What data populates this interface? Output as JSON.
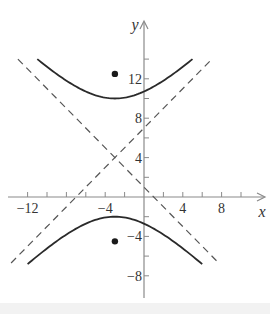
{
  "chart_data": {
    "type": "line",
    "title": "",
    "xlabel": "x",
    "ylabel": "y",
    "xlim": [
      -14,
      12
    ],
    "ylim": [
      -10,
      16
    ],
    "grid": false,
    "x_ticks": [
      -12,
      -10,
      -8,
      -6,
      -4,
      -2,
      2,
      4,
      6,
      8,
      10
    ],
    "x_tick_labels": [
      {
        "value": -12,
        "label": "−12"
      },
      {
        "value": -4,
        "label": "−4"
      },
      {
        "value": 4,
        "label": "4"
      },
      {
        "value": 8,
        "label": "8"
      }
    ],
    "y_ticks": [
      -8,
      -6,
      -4,
      -2,
      2,
      4,
      6,
      8,
      10,
      12,
      14
    ],
    "y_tick_labels": [
      {
        "value": 12,
        "label": "12"
      },
      {
        "value": 8,
        "label": "8"
      },
      {
        "value": 4,
        "label": "4"
      },
      {
        "value": -4,
        "label": "−4"
      },
      {
        "value": -8,
        "label": "−8"
      }
    ],
    "series": [
      {
        "name": "hyperbola upper branch",
        "style": "solid",
        "equation": "(y-4)^2/36 - (x+3)^2/36 = 1",
        "x_range": [
          -11,
          5
        ],
        "center": [
          -3,
          4
        ],
        "vertex": [
          -3,
          10
        ]
      },
      {
        "name": "hyperbola lower branch",
        "style": "solid",
        "equation": "(y-4)^2/36 - (x+3)^2/36 = 1",
        "x_range": [
          -12,
          6
        ],
        "center": [
          -3,
          4
        ],
        "vertex": [
          -3,
          -2
        ]
      },
      {
        "name": "asymptote y = x + 7",
        "style": "dashed",
        "x_range": [
          -13.7,
          6.8
        ]
      },
      {
        "name": "asymptote y = -x + 1",
        "style": "dashed",
        "x_range": [
          -13,
          7.5
        ]
      }
    ],
    "points": [
      {
        "name": "focus upper",
        "x": -3,
        "y": 12.5
      },
      {
        "name": "focus lower",
        "x": -3,
        "y": -4.5
      }
    ]
  }
}
